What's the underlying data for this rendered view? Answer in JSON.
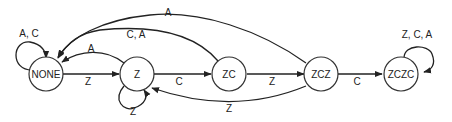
{
  "diagram": {
    "type": "state-machine",
    "states": [
      {
        "id": "NONE",
        "label": "NONE"
      },
      {
        "id": "Z",
        "label": "Z"
      },
      {
        "id": "ZC",
        "label": "ZC"
      },
      {
        "id": "ZCZ",
        "label": "ZCZ"
      },
      {
        "id": "ZCZC",
        "label": "ZCZC"
      }
    ],
    "transitions": [
      {
        "from": "NONE",
        "to": "NONE",
        "label": "A, C"
      },
      {
        "from": "NONE",
        "to": "Z",
        "label": "Z"
      },
      {
        "from": "Z",
        "to": "NONE",
        "label": "A"
      },
      {
        "from": "Z",
        "to": "Z",
        "label": "Z"
      },
      {
        "from": "Z",
        "to": "ZC",
        "label": "C"
      },
      {
        "from": "ZC",
        "to": "NONE",
        "label": "C, A"
      },
      {
        "from": "ZC",
        "to": "ZCZ",
        "label": "Z"
      },
      {
        "from": "ZCZ",
        "to": "NONE",
        "label": "A"
      },
      {
        "from": "ZCZ",
        "to": "Z",
        "label": "Z"
      },
      {
        "from": "ZCZ",
        "to": "ZCZC",
        "label": "C"
      },
      {
        "from": "ZCZC",
        "to": "ZCZC",
        "label": "Z, C, A"
      }
    ]
  }
}
